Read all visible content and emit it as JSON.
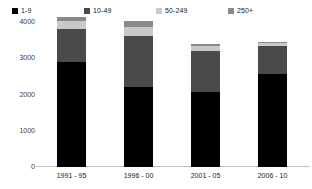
{
  "chart_data": {
    "type": "bar",
    "title": "",
    "subtitle": "",
    "xlabel": "",
    "ylabel": "",
    "stacked": true,
    "grid": false,
    "legend_position": "top",
    "ylim": [
      0,
      4000
    ],
    "yticks": [
      0,
      1000,
      2000,
      3000,
      4000
    ],
    "ytick_labels": [
      "0",
      "1000",
      "2000",
      "3000",
      "4000"
    ],
    "categories": [
      "1991 - 95",
      "1996 - 00",
      "2001 - 05",
      "2006 - 10"
    ],
    "series": [
      {
        "name": "1-9",
        "color": "#000000",
        "values": [
          2900,
          2220,
          2070,
          2560
        ]
      },
      {
        "name": "10-49",
        "color": "#4a4a4a",
        "values": [
          900,
          1400,
          1130,
          770
        ]
      },
      {
        "name": "50-249",
        "color": "#c9c9c9",
        "values": [
          230,
          230,
          130,
          80
        ]
      },
      {
        "name": "250+",
        "color": "#8a8a8a",
        "values": [
          120,
          170,
          60,
          30
        ]
      }
    ],
    "totals": [
      4150,
      4020,
      3390,
      3440
    ]
  },
  "legend": {
    "items": [
      {
        "label": "1-9",
        "color": "#000000",
        "icon": "legend-swatch-icon"
      },
      {
        "label": "10-49",
        "color": "#4a4a4a",
        "icon": "legend-swatch-icon"
      },
      {
        "label": "50-249",
        "color": "#c9c9c9",
        "icon": "legend-swatch-icon"
      },
      {
        "label": "250+",
        "color": "#8a8a8a",
        "icon": "legend-swatch-icon"
      }
    ]
  },
  "axes": {
    "y_labels": [
      "4000",
      "3000",
      "2000",
      "1000",
      "0"
    ],
    "x_labels": [
      "1991 - 95",
      "1996 - 00",
      "2001 - 05",
      "2006 - 10"
    ]
  }
}
